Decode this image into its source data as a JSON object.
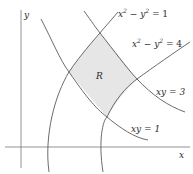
{
  "diagram": {
    "axes": {
      "x_label": "x",
      "y_label": "y"
    },
    "region_label": "R",
    "curves": [
      {
        "id": "hyperbola-1",
        "equation": "x² − y² = 1",
        "label_main": "x",
        "sup1": "2",
        "mid": " − y",
        "sup2": "2",
        "rhs": " = 1"
      },
      {
        "id": "hyperbola-4",
        "equation": "x² − y² = 4",
        "label_main": "x",
        "sup1": "2",
        "mid": " − y",
        "sup2": "2",
        "rhs": " = 4"
      },
      {
        "id": "xy-3",
        "equation": "xy = 3"
      },
      {
        "id": "xy-1",
        "equation": "xy = 1"
      }
    ],
    "colors": {
      "region_fill": "#e6e6e6",
      "curve_stroke": "#5a5a5a",
      "axis_stroke": "#777777"
    }
  }
}
